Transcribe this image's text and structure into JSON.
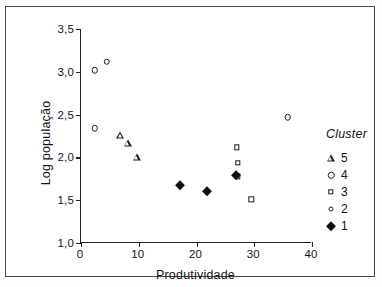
{
  "chart_data": {
    "type": "scatter",
    "title": "",
    "xlabel": "Produtividade",
    "ylabel": "Log população",
    "xlim": [
      0,
      40
    ],
    "ylim": [
      1.0,
      3.5
    ],
    "xticks": [
      "0",
      "10",
      "20",
      "30",
      "40"
    ],
    "xtick_values": [
      0,
      10,
      20,
      30,
      40
    ],
    "yticks": [
      "1,0",
      "1,5",
      "2,0",
      "2,5",
      "3,0",
      "3,5"
    ],
    "ytick_values": [
      1.0,
      1.5,
      2.0,
      2.5,
      3.0,
      3.5
    ],
    "grid": false,
    "legend_position": "right",
    "legend_title": "Cluster",
    "series": [
      {
        "name": "5",
        "marker": "open-triangle",
        "points": [
          {
            "x": 6.8,
            "y": 2.26
          },
          {
            "x": 8.1,
            "y": 2.17
          },
          {
            "x": 9.7,
            "y": 2.01
          }
        ]
      },
      {
        "name": "4",
        "marker": "open-circle",
        "points": [
          {
            "x": 2.4,
            "y": 3.02
          },
          {
            "x": 4.5,
            "y": 3.12
          },
          {
            "x": 2.4,
            "y": 2.34
          },
          {
            "x": 35.8,
            "y": 2.47
          }
        ]
      },
      {
        "name": "3",
        "marker": "open-square",
        "points": [
          {
            "x": 27.0,
            "y": 2.12
          },
          {
            "x": 27.2,
            "y": 1.94
          },
          {
            "x": 27.1,
            "y": 1.78
          },
          {
            "x": 29.5,
            "y": 1.51
          }
        ]
      },
      {
        "name": "2",
        "marker": "small-open-circle",
        "points": []
      },
      {
        "name": "1",
        "marker": "filled-diamond",
        "points": [
          {
            "x": 17.2,
            "y": 1.68
          },
          {
            "x": 21.8,
            "y": 1.61
          },
          {
            "x": 26.8,
            "y": 1.79
          }
        ]
      }
    ]
  },
  "legend": {
    "title": "Cluster",
    "items": [
      {
        "label": "5",
        "marker": "open-triangle"
      },
      {
        "label": "4",
        "marker": "open-circle"
      },
      {
        "label": "3",
        "marker": "open-square"
      },
      {
        "label": "2",
        "marker": "small-open-circle"
      },
      {
        "label": "1",
        "marker": "filled-diamond"
      }
    ]
  }
}
